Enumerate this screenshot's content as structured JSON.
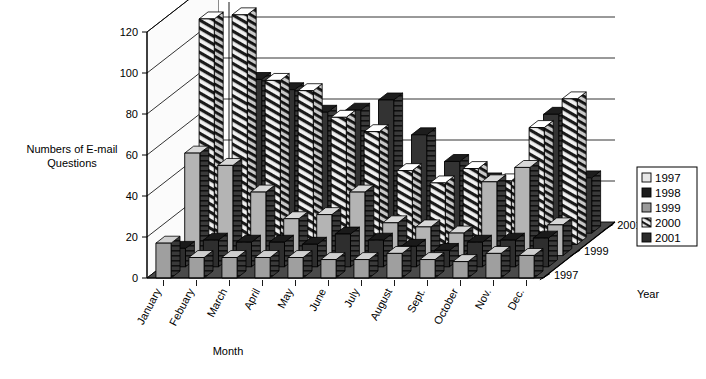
{
  "chart_data": {
    "type": "bar",
    "title": "",
    "subtitle": "",
    "xlabel": "Month",
    "ylabel": "Numbers of E-mail Questions",
    "zlabel": "Year",
    "ylim": [
      0,
      120
    ],
    "ytick_labels": [
      "0",
      "20",
      "40",
      "60",
      "80",
      "100",
      "120"
    ],
    "ytick_values": [
      0,
      20,
      40,
      60,
      80,
      100,
      120
    ],
    "grid": true,
    "three_d": true,
    "legend_position": "right",
    "categories": [
      "January",
      "Febuary",
      "March",
      "April",
      "May",
      "June",
      "July",
      "August",
      "Sept.",
      "October",
      "Nov.",
      "Dec."
    ],
    "zaxis_tick_labels": [
      "1997",
      "1999",
      "2001"
    ],
    "legend_entries": [
      "1997",
      "1998",
      "1999",
      "2000",
      "2001"
    ],
    "series": [
      {
        "name": "1997",
        "values": [
          17,
          10,
          10,
          10,
          10,
          9,
          9,
          12,
          9,
          8,
          12,
          11
        ]
      },
      {
        "name": "1998",
        "values": [
          9,
          13,
          12,
          12,
          11,
          16,
          13,
          10,
          8,
          12,
          13,
          14
        ]
      },
      {
        "name": "1999",
        "values": [
          50,
          44,
          31,
          18,
          20,
          31,
          16,
          14,
          11,
          36,
          43,
          15
        ]
      },
      {
        "name": "2000",
        "values": [
          110,
          112,
          80,
          75,
          62,
          55,
          36,
          30,
          37,
          31,
          57,
          71
        ]
      },
      {
        "name": "2001",
        "values": [
          0,
          75,
          70,
          59,
          60,
          65,
          48,
          35,
          26,
          24,
          58,
          27
        ]
      }
    ]
  },
  "axis": {
    "ylabel_line1": "Numbers of E-mail",
    "ylabel_line2": "Questions",
    "xlabel": "Month",
    "zlabel": "Year"
  },
  "legend": {
    "items": [
      {
        "label": "1997",
        "swatch": "light"
      },
      {
        "label": "1998",
        "swatch": "black"
      },
      {
        "label": "1999",
        "swatch": "gray"
      },
      {
        "label": "2000",
        "swatch": "hatch"
      },
      {
        "label": "2001",
        "swatch": "dark"
      }
    ]
  }
}
